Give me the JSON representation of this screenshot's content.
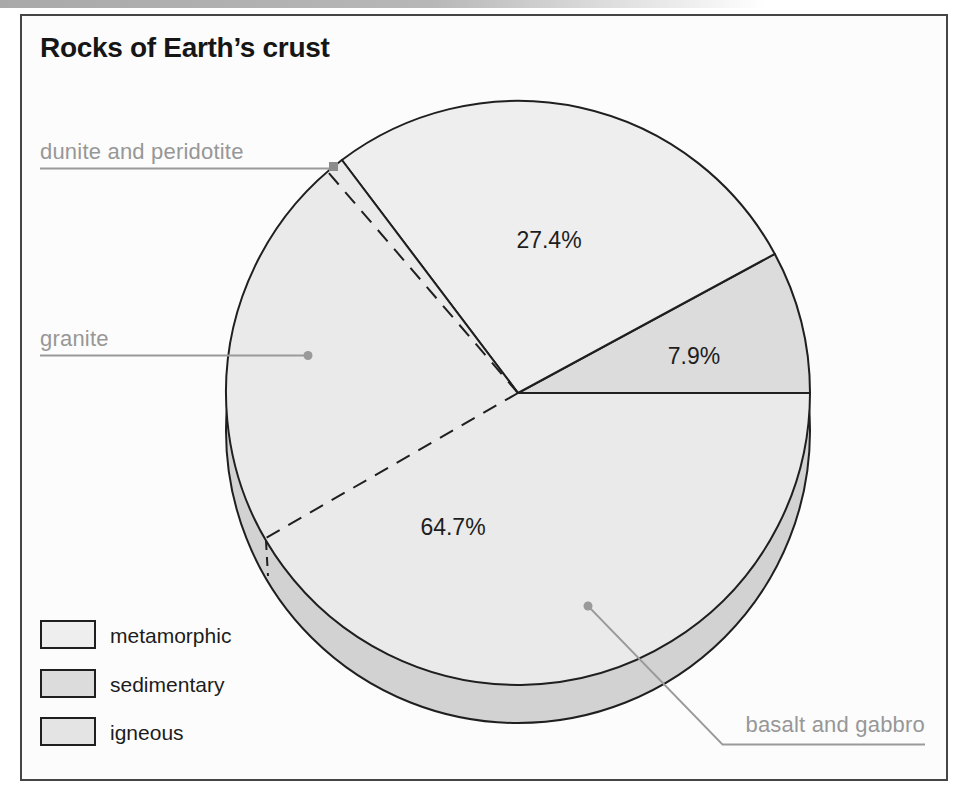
{
  "chart_data": {
    "type": "pie",
    "title": "Rocks of Earth’s crust",
    "unit": "%",
    "style": "3d-depth, flat gray fills, black outlines",
    "start_angle_deg": 0,
    "direction": "ccw",
    "slices": [
      {
        "label": "sedimentary",
        "value": 7.9,
        "display": "7.9%",
        "color": "#dcdcdc"
      },
      {
        "label": "metamorphic",
        "value": 27.4,
        "display": "27.4%",
        "color": "#eeeeee"
      },
      {
        "label": "igneous",
        "value": 64.7,
        "display": "64.7%",
        "color": "#eaeaea"
      }
    ],
    "igneous_subdivisions_labeled": [
      "dunite and peridotite",
      "granite",
      "basalt and gabbro"
    ],
    "dashed_divider_angles_deg": [
      130.7,
      209.9
    ],
    "legend_position": "bottom-left"
  },
  "labels": {
    "dunite": "dunite and peridotite",
    "granite": "granite",
    "basalt": "basalt and gabbro"
  },
  "legend": {
    "items": [
      {
        "label": "metamorphic",
        "color": "#eeeeee"
      },
      {
        "label": "sedimentary",
        "color": "#dcdcdc"
      },
      {
        "label": "igneous",
        "color": "#e4e4e4"
      }
    ]
  },
  "colors": {
    "outline": "#1f1f1f",
    "rim": "#d2d2d2",
    "callout": "#989898",
    "frame_border": "#454545",
    "frame_fill": "#fcfcfc"
  }
}
